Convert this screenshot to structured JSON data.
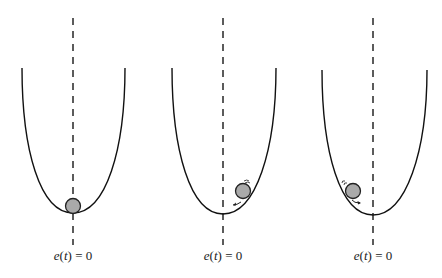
{
  "diagram": {
    "type": "potential-well-illustration",
    "colors": {
      "curve": "#111111",
      "dashed_axis": "#333333",
      "ball_fill": "#aaaaaa",
      "ball_stroke": "#222222",
      "label": "#222222"
    },
    "panels": [
      {
        "id": "panel-1",
        "label": "e(t) = 0",
        "label_parts": {
          "func": "e",
          "arg": "t",
          "rhs": "= 0"
        },
        "ball_state": "at-rest-at-bottom",
        "motion_marks": false
      },
      {
        "id": "panel-2",
        "label": "e(t) = 0",
        "label_parts": {
          "func": "e",
          "arg": "t",
          "rhs": "= 0"
        },
        "ball_state": "on-right-slope-rolling-down",
        "motion_marks": true
      },
      {
        "id": "panel-3",
        "label": "e(t) = 0",
        "label_parts": {
          "func": "e",
          "arg": "t",
          "rhs": "= 0"
        },
        "ball_state": "on-left-slope-rolling-down",
        "motion_marks": true
      }
    ]
  }
}
